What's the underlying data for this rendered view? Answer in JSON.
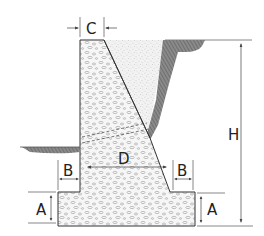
{
  "diagram": {
    "type": "retaining-wall-cross-section",
    "labels": {
      "top_width": "C",
      "base_width": "D",
      "heel_toe_left": "B",
      "heel_toe_right": "B",
      "footing_thickness_left": "A",
      "footing_thickness_right": "A",
      "height": "H"
    },
    "colors": {
      "line": "#333333",
      "concrete_fill": "#f4f4f4",
      "aggregate": "#9a9a9a",
      "backfill_fill": "#eeeeee",
      "soil_hatch": "#7a7a7a"
    }
  }
}
